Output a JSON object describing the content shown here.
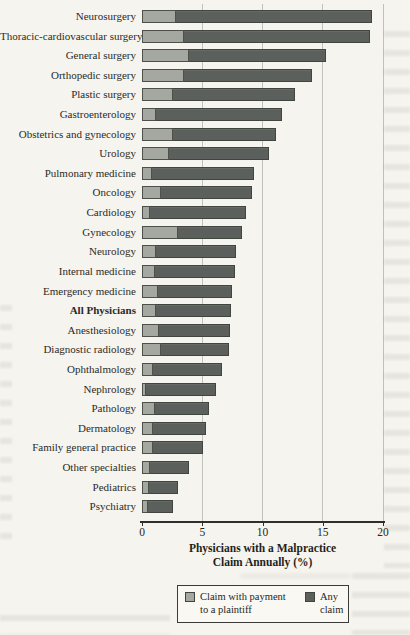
{
  "page": {
    "background": "#f6f4ee"
  },
  "chart_data": {
    "type": "bar",
    "orientation": "horizontal",
    "overlay": "payment bar drawn at left end inside total (any-claim) bar",
    "title": "",
    "xlabel": "Physicians with a Malpractice Claim Annually (%)",
    "ylabel": "",
    "xlim": [
      0,
      20
    ],
    "xticks": [
      0,
      5,
      10,
      15,
      20
    ],
    "grid": "vertical gridlines at 5, 10, 15, 20",
    "legend_position": "below axis title, boxed",
    "bold_category": "All Physicians",
    "categories": [
      "Neurosurgery",
      "Thoracic-cardiovascular surgery",
      "General surgery",
      "Orthopedic surgery",
      "Plastic surgery",
      "Gastroenterology",
      "Obstetrics and gynecology",
      "Urology",
      "Pulmonary medicine",
      "Oncology",
      "Cardiology",
      "Gynecology",
      "Neurology",
      "Internal medicine",
      "Emergency medicine",
      "All Physicians",
      "Anesthesiology",
      "Diagnostic radiology",
      "Ophthalmology",
      "Nephrology",
      "Pathology",
      "Dermatology",
      "Family general practice",
      "Other specialties",
      "Pediatrics",
      "Psychiatry"
    ],
    "series": [
      {
        "name": "Claim with payment to a plaintiff",
        "color": "#a5a8a0",
        "values": [
          2.8,
          3.5,
          3.9,
          3.5,
          2.6,
          1.2,
          2.6,
          2.2,
          0.8,
          1.6,
          0.7,
          3.0,
          1.2,
          1.1,
          1.3,
          1.2,
          1.4,
          1.6,
          0.9,
          0.3,
          1.1,
          0.9,
          0.9,
          0.7,
          0.6,
          0.5
        ]
      },
      {
        "name": "Any claim",
        "color": "#5c605d",
        "values": [
          19.1,
          18.9,
          15.3,
          14.1,
          12.7,
          11.6,
          11.1,
          10.5,
          9.3,
          9.1,
          8.6,
          8.3,
          7.8,
          7.7,
          7.5,
          7.4,
          7.3,
          7.2,
          6.6,
          6.1,
          5.6,
          5.3,
          5.1,
          3.9,
          3.0,
          2.6
        ]
      }
    ]
  },
  "axis": {
    "title_line1": "Physicians with a Malpractice",
    "title_line2": "Claim Annually (%)"
  },
  "legend": {
    "payment_label": "Claim with payment to a plaintiff",
    "any_label": "Any claim"
  },
  "colors": {
    "bar_dark": "#5c605d",
    "bar_light": "#a5a8a0",
    "bar_border": "#41453f",
    "gridline": "#bfc1bb",
    "axis_line": "#2e302c",
    "page_background": "#f6f4ee",
    "text": "#262622"
  }
}
